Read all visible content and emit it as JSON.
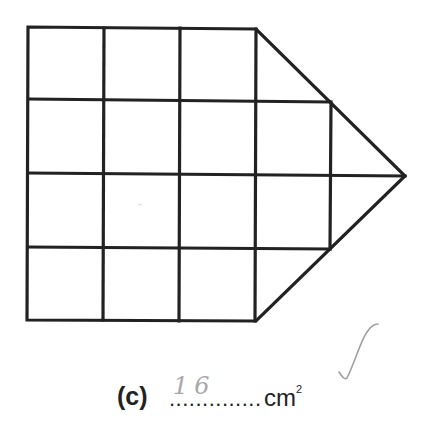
{
  "figure": {
    "grid": {
      "columns": 4,
      "rows": 4,
      "stroke_color": "#222222"
    }
  },
  "question": {
    "part_label": "(c)",
    "dots": "..............",
    "unit": "cm",
    "unit_superscript": "2",
    "student_answer": "16",
    "answer_color": "#a8a8a8"
  },
  "marking": {
    "tick_icon": "check-mark"
  }
}
